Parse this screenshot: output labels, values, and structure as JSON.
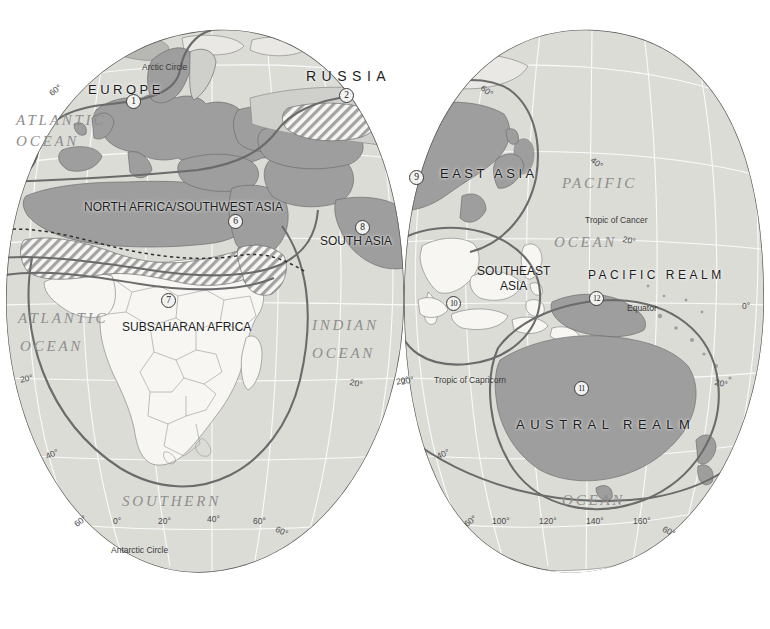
{
  "map": {
    "title": "World Geographic Realms",
    "colors": {
      "ocean_fill": "#dcdcd8",
      "land_plain": "#f2f1ee",
      "land_highlight": "#9e9e9e",
      "realm_border": "#6b6b6b",
      "country_border": "#7a7a7a",
      "graticule": "#ffffff",
      "text_dark": "#1d1d1d",
      "text_ocean": "#8e8e8e"
    },
    "realms": [
      {
        "id": 1,
        "name": "EUROPE",
        "marker": "1",
        "label_x": 88,
        "label_y": 82,
        "marker_x": 126,
        "marker_y": 94,
        "font_size": 13,
        "spacing": "sp2",
        "lines": [
          "EUROPE"
        ]
      },
      {
        "id": 2,
        "name": "RUSSIA",
        "marker": "2",
        "label_x": 306,
        "label_y": 68,
        "marker_x": 339,
        "marker_y": 88,
        "font_size": 14,
        "spacing": "sp1",
        "lines": [
          "RUSSIA"
        ]
      },
      {
        "id": 6,
        "name": "NORTH AFRICA/SOUTHWEST ASIA",
        "marker": "6",
        "label_x": 84,
        "label_y": 200,
        "marker_x": 228,
        "marker_y": 214,
        "font_size": 12,
        "spacing": "",
        "lines": [
          "NORTH AFRICA/SOUTHWEST ASIA"
        ]
      },
      {
        "id": 7,
        "name": "SUBSAHARAN AFRICA",
        "marker": "7",
        "label_x": 122,
        "label_y": 320,
        "marker_x": 161,
        "marker_y": 293,
        "font_size": 12,
        "spacing": "",
        "lines": [
          "SUBSAHARAN AFRICA"
        ]
      },
      {
        "id": 8,
        "name": "SOUTH ASIA",
        "marker": "8",
        "label_x": 320,
        "label_y": 234,
        "marker_x": 355,
        "marker_y": 220,
        "font_size": 12,
        "spacing": "",
        "lines": [
          "SOUTH ASIA"
        ]
      },
      {
        "id": 9,
        "name": "EAST ASIA",
        "marker": "9",
        "label_x": 440,
        "label_y": 166,
        "marker_x": 409,
        "marker_y": 170,
        "font_size": 13,
        "spacing": "sp2",
        "lines": [
          "EAST ASIA"
        ]
      },
      {
        "id": 10,
        "name": "SOUTHEAST ASIA",
        "marker": "10",
        "label_x": 477,
        "label_y": 264,
        "marker_x": 446,
        "marker_y": 296,
        "font_size": 12,
        "spacing": "",
        "lines": [
          "SOUTHEAST",
          "ASIA"
        ]
      },
      {
        "id": 11,
        "name": "AUSTRAL REALM",
        "marker": "11",
        "label_x": 516,
        "label_y": 417,
        "marker_x": 574,
        "marker_y": 381,
        "font_size": 13,
        "spacing": "sp1",
        "lines": [
          "AUSTRAL  REALM"
        ]
      },
      {
        "id": 12,
        "name": "PACIFIC REALM",
        "marker": "12",
        "label_x": 588,
        "label_y": 268,
        "marker_x": 589,
        "marker_y": 291,
        "font_size": 12,
        "spacing": "sp2",
        "lines": [
          "PACIFIC REALM"
        ]
      }
    ],
    "oceans": [
      {
        "text": "ATLANTIC",
        "x": 16,
        "y": 112,
        "size": "big"
      },
      {
        "text": "OCEAN",
        "x": 16,
        "y": 133,
        "size": "big"
      },
      {
        "text": "ATLANTIC",
        "x": 18,
        "y": 310,
        "size": "big"
      },
      {
        "text": "OCEAN",
        "x": 20,
        "y": 338,
        "size": "big"
      },
      {
        "text": "INDIAN",
        "x": 312,
        "y": 317,
        "size": "big"
      },
      {
        "text": "OCEAN",
        "x": 312,
        "y": 345,
        "size": "big"
      },
      {
        "text": "PACIFIC",
        "x": 562,
        "y": 175,
        "size": "big"
      },
      {
        "text": "OCEAN",
        "x": 554,
        "y": 234,
        "size": "big"
      },
      {
        "text": "SOUTHERN",
        "x": 122,
        "y": 493,
        "size": "big"
      },
      {
        "text": "OCEAN",
        "x": 562,
        "y": 492,
        "size": "big"
      }
    ],
    "special_lines": [
      {
        "text": "Arctic Circle",
        "x": 142,
        "y": 62
      },
      {
        "text": "Tropic of Cancer",
        "x": 585,
        "y": 215
      },
      {
        "text": "Equator",
        "x": 627,
        "y": 303
      },
      {
        "text": "Tropic of Capricorn",
        "x": 434,
        "y": 375
      },
      {
        "text": "Antarctic Circle",
        "x": 111,
        "y": 545
      }
    ],
    "coordinates": [
      {
        "text": "60°",
        "x": 47,
        "y": 90,
        "rot": "rot-a"
      },
      {
        "text": "40°",
        "x": 595,
        "y": 155,
        "rot": "rot-b"
      },
      {
        "text": "20°",
        "x": 624,
        "y": 234,
        "rot": "rot-f"
      },
      {
        "text": "0°",
        "x": 742,
        "y": 301,
        "rot": ""
      },
      {
        "text": "60°",
        "x": 485,
        "y": 83,
        "rot": "rot-b"
      },
      {
        "text": "20°",
        "x": 19,
        "y": 375,
        "rot": "rot-e"
      },
      {
        "text": "40°",
        "x": 44,
        "y": 452,
        "rot": "rot-c"
      },
      {
        "text": "60°",
        "x": 72,
        "y": 521,
        "rot": "rot-a"
      },
      {
        "text": "0°",
        "x": 113,
        "y": 516,
        "rot": ""
      },
      {
        "text": "20°",
        "x": 158,
        "y": 516,
        "rot": ""
      },
      {
        "text": "40°",
        "x": 207,
        "y": 514,
        "rot": ""
      },
      {
        "text": "60°",
        "x": 253,
        "y": 516,
        "rot": ""
      },
      {
        "text": "60°",
        "x": 278,
        "y": 524,
        "rot": "rot-d"
      },
      {
        "text": "20°",
        "x": 351,
        "y": 377,
        "rot": "rot-f"
      },
      {
        "text": "20°",
        "x": 395,
        "y": 377,
        "rot": "rot-e"
      },
      {
        "text": "20°",
        "x": 400,
        "y": 377,
        "rot": "rot-e"
      },
      {
        "text": "20°",
        "x": 716,
        "y": 377,
        "rot": "rot-f"
      },
      {
        "text": "40°",
        "x": 435,
        "y": 452,
        "rot": "rot-c"
      },
      {
        "text": "60°",
        "x": 462,
        "y": 521,
        "rot": "rot-a"
      },
      {
        "text": "100°",
        "x": 492,
        "y": 516,
        "rot": ""
      },
      {
        "text": "120°",
        "x": 539,
        "y": 516,
        "rot": ""
      },
      {
        "text": "140°",
        "x": 586,
        "y": 516,
        "rot": ""
      },
      {
        "text": "160°",
        "x": 633,
        "y": 516,
        "rot": ""
      },
      {
        "text": "60°",
        "x": 665,
        "y": 524,
        "rot": "rot-d"
      }
    ]
  }
}
